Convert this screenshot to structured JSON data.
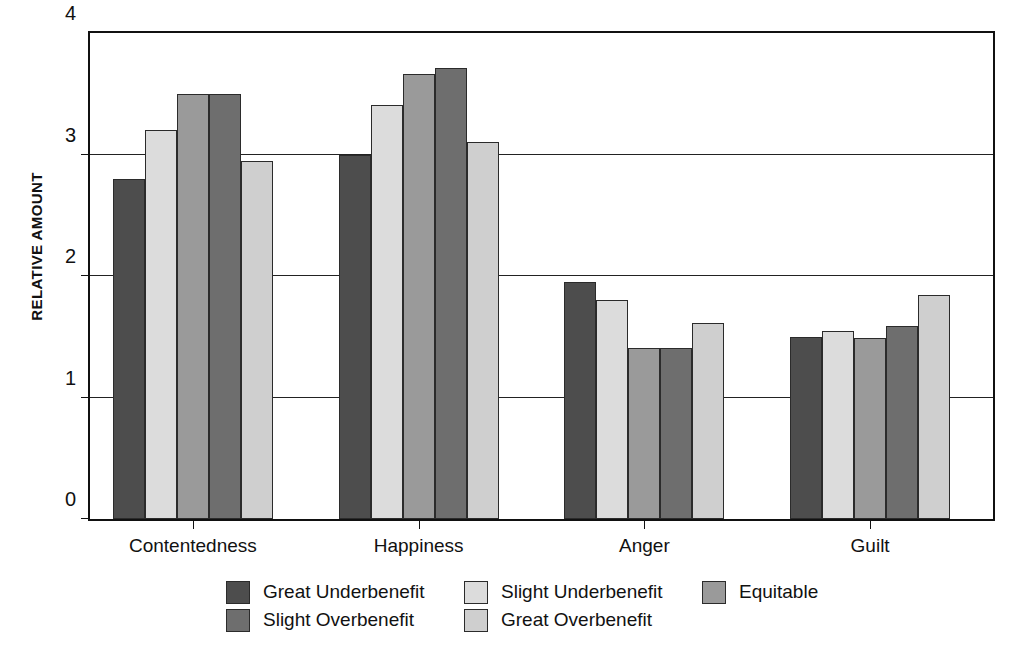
{
  "chart_data": {
    "type": "bar",
    "title": "",
    "subtitle": "",
    "xlabel": "",
    "ylabel": "RELATIVE AMOUNT",
    "categories": [
      "Contentedness",
      "Happiness",
      "Anger",
      "Guilt"
    ],
    "ylim": [
      0,
      4
    ],
    "yticks": [
      0,
      1,
      2,
      3,
      4
    ],
    "ytick_labels": [
      "0",
      "1",
      "2",
      "3",
      "4"
    ],
    "grid": "horizontal",
    "legend_position": "bottom",
    "series": [
      {
        "name": "Great Underbenefit",
        "color": "#4d4d4d",
        "values": [
          2.8,
          3.0,
          1.95,
          1.5
        ]
      },
      {
        "name": "Slight Underbenefit",
        "color": "#dcdcdc",
        "values": [
          3.2,
          3.41,
          1.8,
          1.55
        ]
      },
      {
        "name": "Equitable",
        "color": "#9a9a9a",
        "values": [
          3.5,
          3.66,
          1.41,
          1.49
        ]
      },
      {
        "name": "Slight Overbenefit",
        "color": "#6e6e6e",
        "values": [
          3.5,
          3.71,
          1.41,
          1.59
        ]
      },
      {
        "name": "Great Overbenefit",
        "color": "#cfcfcf",
        "values": [
          2.95,
          3.1,
          1.61,
          1.84
        ]
      }
    ]
  },
  "legend": {
    "rows": [
      [
        "Great Underbenefit",
        "Slight Underbenefit",
        "Equitable"
      ],
      [
        "Slight Overbenefit",
        "Great Overbenefit"
      ]
    ]
  },
  "style": {
    "axis_color": "#111111",
    "bar_border": "#2b2b2b",
    "background": "#ffffff"
  }
}
